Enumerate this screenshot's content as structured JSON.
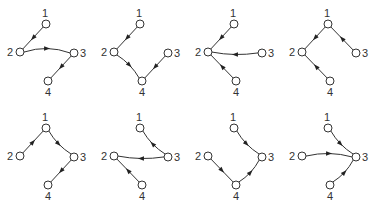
{
  "figure": {
    "node_labels": [
      "1",
      "2",
      "3",
      "4"
    ],
    "layout": {
      "rows": 2,
      "cols": 4,
      "panel_dx": 94,
      "panel_dy": 104
    },
    "node_positions": {
      "1": [
        46,
        24
      ],
      "2": [
        20,
        52
      ],
      "3": [
        74,
        53
      ],
      "4": [
        48,
        81
      ]
    },
    "label_positions": {
      "1": [
        45,
        17,
        "middle"
      ],
      "2": [
        13,
        56,
        "end"
      ],
      "3": [
        80,
        57,
        "start"
      ],
      "4": [
        48,
        96,
        "middle"
      ]
    },
    "panels": [
      {
        "id": "a",
        "edges": [
          {
            "from": "1",
            "to": "2"
          },
          {
            "from": "2",
            "to": "3",
            "curve": -8
          },
          {
            "from": "3",
            "to": "4"
          }
        ]
      },
      {
        "id": "b",
        "edges": [
          {
            "from": "1",
            "to": "2"
          },
          {
            "from": "2",
            "to": "4",
            "curve": -4
          },
          {
            "from": "3",
            "to": "4"
          }
        ]
      },
      {
        "id": "c",
        "edges": [
          {
            "from": "1",
            "to": "2"
          },
          {
            "from": "3",
            "to": "2",
            "curve": -4
          },
          {
            "from": "4",
            "to": "2"
          }
        ]
      },
      {
        "id": "d",
        "edges": [
          {
            "from": "1",
            "to": "2"
          },
          {
            "from": "3",
            "to": "1"
          },
          {
            "from": "4",
            "to": "2"
          }
        ]
      },
      {
        "id": "e",
        "edges": [
          {
            "from": "2",
            "to": "1"
          },
          {
            "from": "1",
            "to": "3",
            "curve": 4
          },
          {
            "from": "3",
            "to": "4"
          }
        ]
      },
      {
        "id": "f",
        "edges": [
          {
            "from": "3",
            "to": "1",
            "curve": -4
          },
          {
            "from": "3",
            "to": "2",
            "curve": -4
          },
          {
            "from": "4",
            "to": "2"
          }
        ]
      },
      {
        "id": "g",
        "edges": [
          {
            "from": "1",
            "to": "3",
            "curve": 4
          },
          {
            "from": "2",
            "to": "4"
          },
          {
            "from": "4",
            "to": "3",
            "curve": 4
          }
        ]
      },
      {
        "id": "h",
        "edges": [
          {
            "from": "1",
            "to": "3",
            "curve": 4
          },
          {
            "from": "2",
            "to": "3",
            "curve": -6
          },
          {
            "from": "4",
            "to": "3",
            "curve": 4
          }
        ]
      }
    ]
  }
}
